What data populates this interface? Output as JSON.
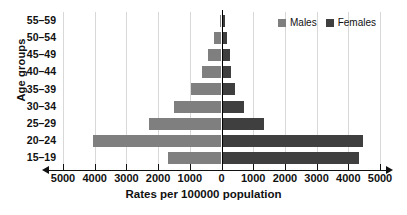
{
  "chart_data": {
    "type": "bar",
    "subtype": "population-pyramid",
    "title": "",
    "xlabel": "Rates per 100000 population",
    "ylabel": "Age groups",
    "categories": [
      "55–59",
      "50–54",
      "45–49",
      "40–44",
      "35–39",
      "30–34",
      "25–29",
      "20–24",
      "15–19"
    ],
    "series": [
      {
        "name": "Males",
        "color": "#7f7f7f",
        "side": "left",
        "values": [
          60,
          250,
          420,
          610,
          950,
          1500,
          2300,
          4050,
          1700
        ]
      },
      {
        "name": "Females",
        "color": "#3f3f3f",
        "side": "right",
        "values": [
          110,
          170,
          260,
          300,
          420,
          720,
          1350,
          4450,
          4350
        ]
      }
    ],
    "xlim": [
      -5000,
      5000
    ],
    "xticks": [
      -5000,
      -4000,
      -3000,
      -2000,
      -1000,
      0,
      1000,
      2000,
      3000,
      4000,
      5000
    ],
    "xtick_labels": [
      "5000",
      "4000",
      "3000",
      "2000",
      "1000",
      "0",
      "1000",
      "2000",
      "3000",
      "4000",
      "5000"
    ],
    "grid": true,
    "legend_position": "top-right"
  },
  "legend": {
    "items": [
      {
        "label": "Males",
        "swatch": "male-swatch"
      },
      {
        "label": "Females",
        "swatch": "female-swatch"
      }
    ]
  },
  "axes": {
    "x_title": "Rates per 100000 population",
    "y_title": "Age groups"
  }
}
